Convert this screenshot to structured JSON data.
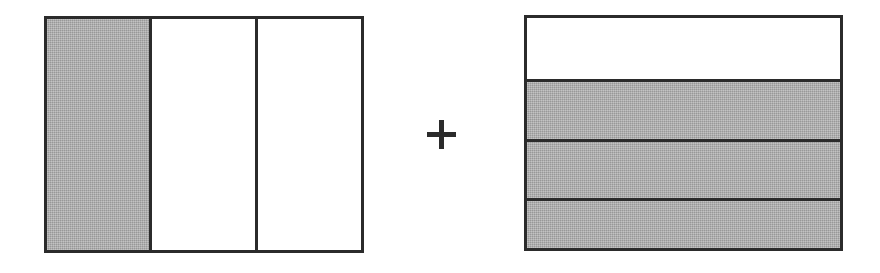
{
  "page": {
    "background_color": "#ffffff",
    "width": 880,
    "height": 273
  },
  "colors": {
    "outline": "#2b2b2b",
    "shaded_fill": "#a9a9a9",
    "unshaded_fill": "#ffffff"
  },
  "operator": {
    "symbol": "+",
    "name": "plus-sign",
    "color": "#2b2b2b"
  },
  "figures": [
    {
      "id": "left-model",
      "orientation": "vertical-columns",
      "partitions": 3,
      "shaded_count": 1,
      "fraction": "1/3",
      "cells": [
        {
          "index": 1,
          "shaded": true,
          "label": "column-1"
        },
        {
          "index": 2,
          "shaded": false,
          "label": "column-2"
        },
        {
          "index": 3,
          "shaded": false,
          "label": "column-3"
        }
      ]
    },
    {
      "id": "right-model",
      "orientation": "horizontal-rows",
      "partitions": 4,
      "shaded_count": 3,
      "fraction": "3/4",
      "cells": [
        {
          "index": 1,
          "shaded": false,
          "label": "row-1"
        },
        {
          "index": 2,
          "shaded": true,
          "label": "row-2"
        },
        {
          "index": 3,
          "shaded": true,
          "label": "row-3"
        },
        {
          "index": 4,
          "shaded": true,
          "label": "row-4"
        }
      ]
    }
  ],
  "expression": "1/3 + 3/4"
}
